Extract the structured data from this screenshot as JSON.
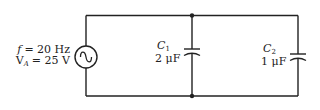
{
  "diagram": {
    "type": "ac-circuit",
    "source": {
      "symbol": "ac-voltage-source",
      "frequency_label": "f = 20 Hz",
      "frequency_var": "f",
      "frequency_value": "= 20 Hz",
      "voltage_var": "V",
      "voltage_sub": "A",
      "voltage_value": "= 25 V"
    },
    "components": [
      {
        "name": "C",
        "sub": "1",
        "value": "2 μF"
      },
      {
        "name": "C",
        "sub": "2",
        "value": "1 μF"
      }
    ],
    "colors": {
      "wire": "#222222",
      "background": "#ffffff"
    }
  }
}
